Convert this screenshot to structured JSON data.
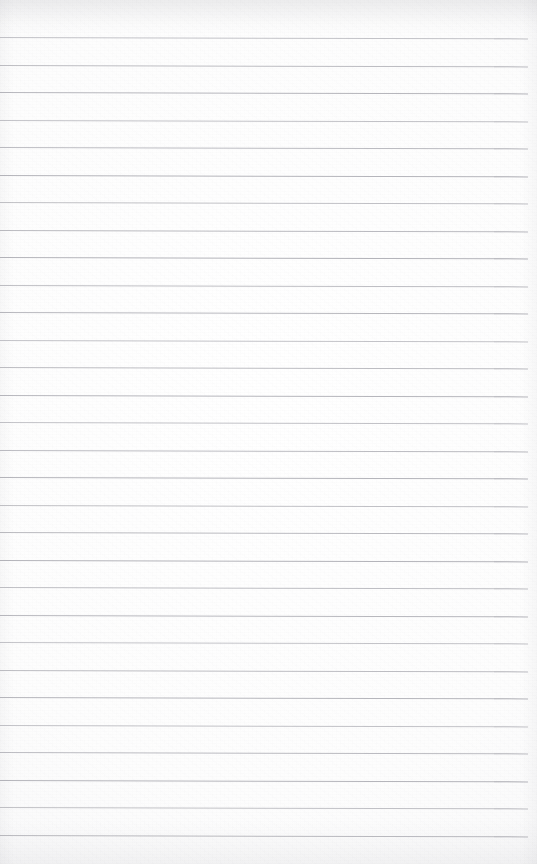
{
  "document": {
    "kind": "scanned-ruled-paper",
    "title": "Blank lined notebook page",
    "page_width": 537,
    "page_height": 864,
    "orientation": "portrait",
    "written_content": "",
    "has_text": false,
    "has_handwriting": false,
    "has_header": false,
    "has_margin_rule": false,
    "has_holes": false
  },
  "paper": {
    "background_color": "#fdfdfd",
    "texture": "light scanner grain",
    "top_edge_shadow_color": "#8a8a92",
    "bottom_edge_shade_color": "#9a9aa2"
  },
  "ruling": {
    "line_color": "#b4b4ba",
    "line_thickness_px": 1,
    "line_count": 30,
    "first_line_y": 37,
    "line_spacing_px": 27.5,
    "line_start_x": 0,
    "line_end_x": 528,
    "tilt_deg": 0.15,
    "top_margin_px": 37,
    "bottom_margin_px": 39
  }
}
